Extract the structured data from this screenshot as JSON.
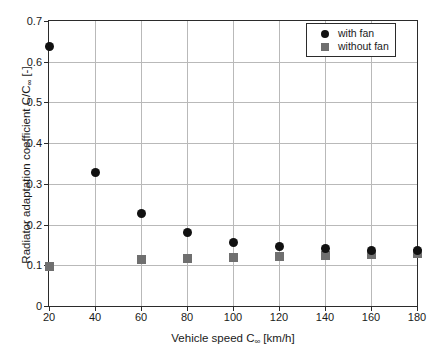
{
  "chart_data": {
    "type": "scatter",
    "title": "",
    "xlabel": "Vehicle speed C∞ [km/h]",
    "xlabel_parts": {
      "pre": "Vehicle speed C",
      "sub": "∞",
      "post": " [km/h]"
    },
    "ylabel": "Radiator adaptation coefficient C/C∞ [-]",
    "ylabel_parts": {
      "pre": "Radiator adaptation coefficient C/C",
      "sub": "∞",
      "post": " [-]"
    },
    "x": [
      20,
      40,
      60,
      80,
      100,
      120,
      140,
      160,
      180
    ],
    "xticks": [
      "20",
      "40",
      "60",
      "80",
      "100",
      "120",
      "140",
      "160",
      "180"
    ],
    "yticks": [
      "0",
      "0.1",
      "0.2",
      "0.3",
      "0.4",
      "0.5",
      "0.6",
      "0.7"
    ],
    "ytick_values": [
      0,
      0.1,
      0.2,
      0.3,
      0.4,
      0.5,
      0.6,
      0.7
    ],
    "xlim": [
      20,
      180
    ],
    "ylim": [
      0,
      0.7
    ],
    "grid": true,
    "legend_position": "top-right",
    "series": [
      {
        "name": "with fan",
        "marker": "circle",
        "color": "#111111",
        "values": [
          0.637,
          0.328,
          0.227,
          0.181,
          0.156,
          0.145,
          0.142,
          0.137,
          0.137
        ]
      },
      {
        "name": "without fan",
        "marker": "square",
        "color": "#6f6f6f",
        "values": [
          0.096,
          null,
          0.113,
          0.116,
          0.119,
          0.121,
          0.124,
          0.127,
          0.129
        ]
      }
    ]
  },
  "legend": {
    "items": [
      {
        "label": "with fan",
        "marker": "circle"
      },
      {
        "label": "without fan",
        "marker": "square"
      }
    ]
  }
}
